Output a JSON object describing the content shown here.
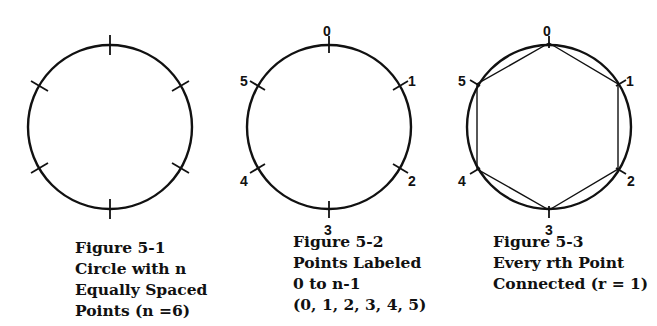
{
  "figures": [
    {
      "id": "5-1",
      "caption": [
        "Figure 5-1",
        "Circle with n",
        "Equally Spaced",
        "Points (n =6)"
      ],
      "n": 6,
      "labels": []
    },
    {
      "id": "5-2",
      "caption": [
        "Figure 5-2",
        "Points Labeled",
        "0 to n-1",
        "(0, 1, 2, 3, 4, 5)"
      ],
      "n": 6,
      "labels": [
        "0",
        "1",
        "2",
        "3",
        "4",
        "5"
      ]
    },
    {
      "id": "5-3",
      "caption": [
        "Figure 5-3",
        "Every rth Point",
        "Connected (r = 1)"
      ],
      "n": 6,
      "r": 1,
      "labels": [
        "0",
        "1",
        "2",
        "3",
        "4",
        "5"
      ]
    }
  ]
}
